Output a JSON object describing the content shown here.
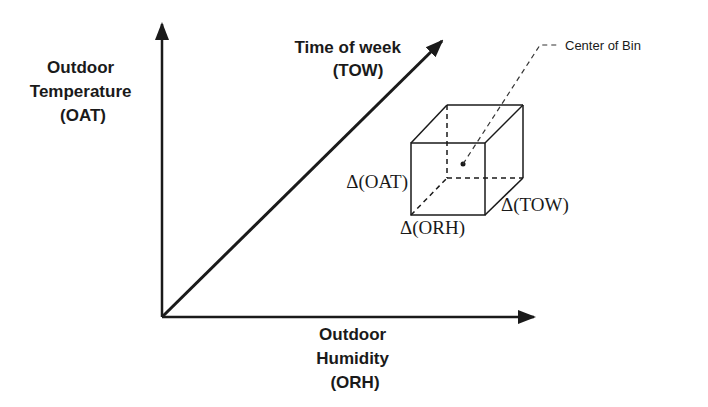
{
  "diagram": {
    "axes": {
      "y": {
        "label_lines": [
          "Outdoor",
          "Temperature",
          "(OAT)"
        ]
      },
      "x": {
        "label_lines": [
          "Outdoor",
          "Humidity",
          "(ORH)"
        ]
      },
      "diagonal": {
        "label_lines": [
          "Time of week",
          "(TOW)"
        ]
      }
    },
    "bin": {
      "center_label": "Center of Bin",
      "delta_oat": "Δ(OAT)",
      "delta_orh": "Δ(ORH)",
      "delta_tow": "Δ(TOW)"
    },
    "colors": {
      "line": "#1a1a1a",
      "background": "#ffffff"
    }
  }
}
